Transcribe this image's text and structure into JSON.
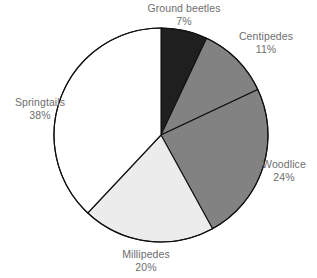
{
  "chart_data": {
    "type": "pie",
    "title": "",
    "subtitle": "",
    "xlabel": "",
    "ylabel": "",
    "legend_position": "none",
    "grid": false,
    "units": "percent",
    "start_angle_deg": 0,
    "direction": "clockwise",
    "categories": [
      "Ground beetles",
      "Centipedes",
      "Woodlice",
      "Millipedes",
      "Springtails"
    ],
    "values": [
      7,
      11,
      24,
      20,
      38
    ],
    "value_labels": [
      "7%",
      "11%",
      "24%",
      "20%",
      "38%"
    ],
    "colors": [
      "#1f1f1f",
      "#828282",
      "#828282",
      "#ececec",
      "#ffffff"
    ],
    "slices": [
      {
        "label": "Ground beetles",
        "value": 7,
        "value_label": "7%",
        "color": "#1f1f1f",
        "label_align": "center"
      },
      {
        "label": "Centipedes",
        "value": 11,
        "value_label": "11%",
        "color": "#828282",
        "label_align": "center"
      },
      {
        "label": "Woodlice",
        "value": 24,
        "value_label": "24%",
        "color": "#828282",
        "label_align": "center"
      },
      {
        "label": "Millipedes",
        "value": 20,
        "value_label": "20%",
        "color": "#ececec",
        "label_align": "center"
      },
      {
        "label": "Springtails",
        "value": 38,
        "value_label": "38%",
        "color": "#ffffff",
        "label_align": "center"
      }
    ]
  },
  "style": {
    "background": "#ffffff",
    "slice_outline": "#111111",
    "label_text": "#6e6e6e"
  },
  "geometry": {
    "center_x": 161,
    "center_y": 135,
    "radius": 107
  }
}
